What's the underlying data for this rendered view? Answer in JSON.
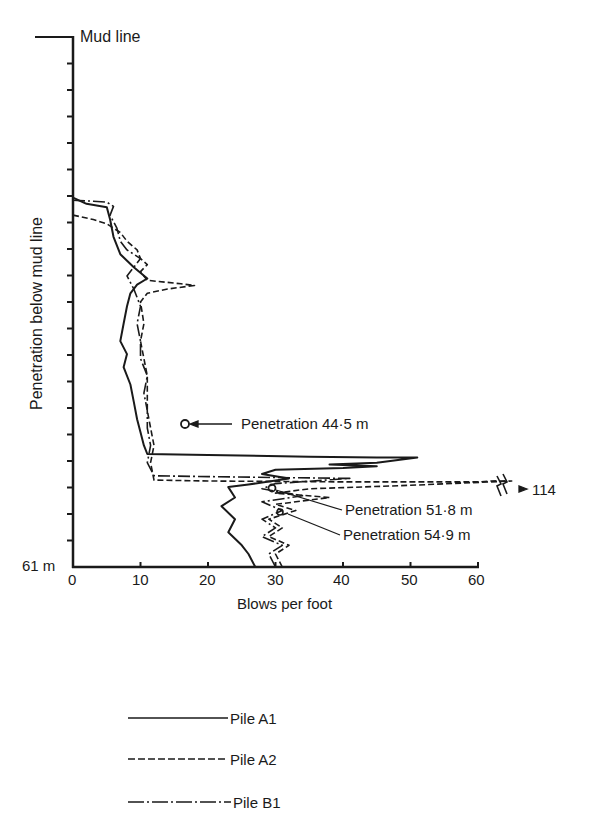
{
  "chart_data": {
    "type": "line",
    "title": "",
    "xlabel": "Blows per foot",
    "ylabel": "Penetration below mud line",
    "xlim": [
      0,
      60
    ],
    "ylim_m": [
      0,
      61
    ],
    "x_ticks": [
      0,
      10,
      20,
      30,
      40,
      50,
      60
    ],
    "y_top_label": "Mud line",
    "y_bottom_label": "61 m",
    "y_tick_count": 20,
    "grid": false,
    "legend_position": "below",
    "series": [
      {
        "name": "Pile A1",
        "style": "solid",
        "points": [
          [
            0,
            18.5
          ],
          [
            2,
            19.2
          ],
          [
            5,
            19.6
          ],
          [
            5.5,
            21
          ],
          [
            6,
            23
          ],
          [
            7,
            25
          ],
          [
            9,
            26.5
          ],
          [
            11,
            27.8
          ],
          [
            9.5,
            28.5
          ],
          [
            8.5,
            29.5
          ],
          [
            8,
            31
          ],
          [
            7.5,
            33
          ],
          [
            7,
            35
          ],
          [
            8,
            36.5
          ],
          [
            7.5,
            38
          ],
          [
            8.5,
            40
          ],
          [
            9,
            42
          ],
          [
            9.5,
            44
          ],
          [
            10,
            45.5
          ],
          [
            10.5,
            47
          ],
          [
            11,
            48
          ],
          [
            20,
            48.1
          ],
          [
            35,
            48.3
          ],
          [
            45,
            48.4
          ],
          [
            51,
            48.4
          ],
          [
            45,
            49
          ],
          [
            38,
            49.2
          ],
          [
            45,
            49.4
          ],
          [
            40,
            49.6
          ],
          [
            30,
            49.8
          ],
          [
            28,
            50.3
          ],
          [
            32,
            50.8
          ],
          [
            26,
            51.5
          ],
          [
            23,
            51.8
          ],
          [
            24,
            53
          ],
          [
            22,
            54
          ],
          [
            24,
            55.5
          ],
          [
            23,
            57
          ],
          [
            25,
            58.5
          ],
          [
            26,
            59.5
          ],
          [
            27,
            61
          ]
        ]
      },
      {
        "name": "Pile A2",
        "style": "dashed",
        "points": [
          [
            0,
            20.5
          ],
          [
            3,
            21
          ],
          [
            5,
            21.5
          ],
          [
            7,
            22.5
          ],
          [
            8,
            23.5
          ],
          [
            9.5,
            24.5
          ],
          [
            10,
            25.5
          ],
          [
            11,
            26.2
          ],
          [
            10,
            27
          ],
          [
            11,
            28
          ],
          [
            16,
            28.4
          ],
          [
            18,
            28.6
          ],
          [
            14,
            29
          ],
          [
            11,
            29.5
          ],
          [
            10,
            30.5
          ],
          [
            10.5,
            33
          ],
          [
            10,
            35
          ],
          [
            10.5,
            37
          ],
          [
            11,
            39
          ],
          [
            11,
            41
          ],
          [
            11,
            43
          ],
          [
            11.5,
            45
          ],
          [
            12,
            47
          ],
          [
            11.5,
            49
          ],
          [
            12,
            51
          ],
          [
            20,
            51.1
          ],
          [
            40,
            51.2
          ],
          [
            60,
            51.2
          ],
          [
            62,
            51.1
          ],
          [
            65,
            51.1
          ],
          [
            50,
            51.6
          ],
          [
            35,
            52
          ],
          [
            30,
            52.5
          ],
          [
            38,
            53
          ],
          [
            30,
            53.8
          ],
          [
            33,
            54.5
          ],
          [
            29,
            55.5
          ],
          [
            31,
            56.5
          ],
          [
            29,
            57.5
          ],
          [
            32,
            58.5
          ],
          [
            30,
            59.5
          ],
          [
            31,
            61
          ]
        ]
      },
      {
        "name": "Pile B1",
        "style": "dash-dot",
        "points": [
          [
            0,
            18.8
          ],
          [
            3,
            18.9
          ],
          [
            5,
            19
          ],
          [
            6,
            19.5
          ],
          [
            5.5,
            20.5
          ],
          [
            6.5,
            22
          ],
          [
            7,
            23.5
          ],
          [
            8,
            24.5
          ],
          [
            10,
            25.5
          ],
          [
            9,
            26.5
          ],
          [
            8,
            27.5
          ],
          [
            9,
            29
          ],
          [
            10,
            31
          ],
          [
            9.5,
            33
          ],
          [
            10,
            35
          ],
          [
            10,
            37
          ],
          [
            11,
            39
          ],
          [
            10.5,
            41
          ],
          [
            11,
            43
          ],
          [
            11,
            45
          ],
          [
            11.5,
            47
          ],
          [
            11,
            49
          ],
          [
            12,
            50.5
          ],
          [
            20,
            50.6
          ],
          [
            30,
            50.7
          ],
          [
            41,
            50.8
          ],
          [
            30,
            51.4
          ],
          [
            28,
            52
          ],
          [
            34,
            52.8
          ],
          [
            28,
            53.5
          ],
          [
            31,
            54.5
          ],
          [
            28,
            55.5
          ],
          [
            30,
            56.5
          ],
          [
            28,
            57.5
          ],
          [
            31,
            58.5
          ],
          [
            29,
            59.5
          ],
          [
            30,
            61
          ]
        ]
      }
    ],
    "annotations": [
      {
        "text": "Penetration 44·5 m",
        "marker_at": [
          16.5,
          44.5
        ]
      },
      {
        "text": "Penetration 51·8 m",
        "marker_at": [
          30,
          51.8
        ]
      },
      {
        "text": "Penetration 54·9 m",
        "marker_at": [
          31,
          54.9
        ]
      },
      {
        "text": "114",
        "note": "Pile A2 peak off-scale, axis break"
      }
    ]
  },
  "labels": {
    "mud_line": "Mud line",
    "bottom_depth": "61 m",
    "y_axis": "Penetration below mud line",
    "x_axis": "Blows per foot",
    "x_ticks": [
      "0",
      "10",
      "20",
      "30",
      "40",
      "50",
      "60"
    ],
    "ann_445": "Penetration 44·5 m",
    "ann_518": "Penetration 51·8 m",
    "ann_549": "Penetration 54·9 m",
    "off_scale": "114"
  },
  "legend": [
    {
      "label": "Pile A1",
      "style": "solid"
    },
    {
      "label": "Pile A2",
      "style": "dashed"
    },
    {
      "label": "Pile B1",
      "style": "dash-dot"
    }
  ],
  "colors": {
    "ink": "#1a1a1a",
    "background": "#ffffff"
  }
}
